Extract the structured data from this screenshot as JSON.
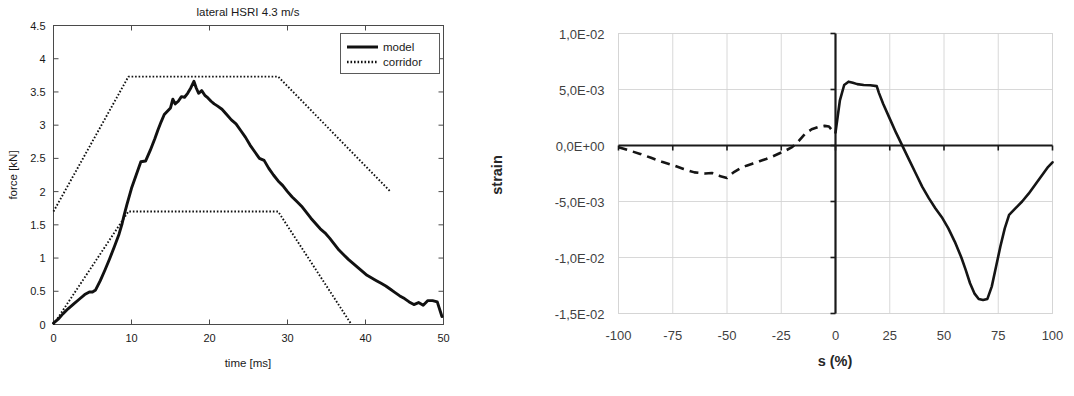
{
  "figure": {
    "background": "#ffffff",
    "panel_count": 2
  },
  "chart_data": [
    {
      "id": "lateral-hsri-force-time",
      "type": "line",
      "title": "lateral HSRI 4.3 m/s",
      "xlabel": "time [ms]",
      "ylabel": "force [kN]",
      "xlim": [
        0,
        50
      ],
      "ylim": [
        0,
        4.5
      ],
      "xticks": [
        0,
        10,
        20,
        30,
        40,
        50
      ],
      "xticklabels": [
        "0",
        "10",
        "20",
        "30",
        "40",
        "50"
      ],
      "yticks": [
        0,
        0.5,
        1,
        1.5,
        2,
        2.5,
        3,
        3.5,
        4,
        4.5
      ],
      "yticklabels": [
        "0",
        "0.5",
        "1",
        "1.5",
        "2",
        "2.5",
        "3",
        "3.5",
        "4",
        "4.5"
      ],
      "grid": false,
      "legend": {
        "position": "top-right",
        "entries": [
          {
            "label": "model",
            "style": "solid"
          },
          {
            "label": "corridor",
            "style": "dotted"
          }
        ]
      },
      "series": [
        {
          "name": "model",
          "style": "solid",
          "x": [
            0,
            0.6,
            1.2,
            1.9,
            2.6,
            3.3,
            4.0,
            4.6,
            5.0,
            5.4,
            6.0,
            6.6,
            7.2,
            7.8,
            8.4,
            8.8,
            9.0,
            9.4,
            10.0,
            10.6,
            11.2,
            11.8,
            12.4,
            13.0,
            13.4,
            13.8,
            14.2,
            14.6,
            15.0,
            15.3,
            15.6,
            16.0,
            16.4,
            16.8,
            17.2,
            17.6,
            18.0,
            18.3,
            18.6,
            19.0,
            19.4,
            19.8,
            20.2,
            20.6,
            21.0,
            21.6,
            22.2,
            22.8,
            23.4,
            24.0,
            24.6,
            25.2,
            25.8,
            26.4,
            27.0,
            27.6,
            28.2,
            28.8,
            29.4,
            30.0,
            30.6,
            31.2,
            31.8,
            32.4,
            33.0,
            33.6,
            34.2,
            34.8,
            35.4,
            36.0,
            36.6,
            37.2,
            37.8,
            38.4,
            39.0,
            39.6,
            40.2,
            40.8,
            41.4,
            42.0,
            42.6,
            43.2,
            43.8,
            44.4,
            45.0,
            45.6,
            46.2,
            46.8,
            47.4,
            48.0,
            48.6,
            49.2,
            49.8
          ],
          "y": [
            0.02,
            0.08,
            0.16,
            0.24,
            0.31,
            0.38,
            0.45,
            0.49,
            0.49,
            0.52,
            0.66,
            0.82,
            0.99,
            1.17,
            1.36,
            1.52,
            1.62,
            1.8,
            2.05,
            2.25,
            2.45,
            2.46,
            2.62,
            2.8,
            2.93,
            3.05,
            3.16,
            3.21,
            3.26,
            3.39,
            3.32,
            3.36,
            3.43,
            3.42,
            3.48,
            3.56,
            3.66,
            3.56,
            3.48,
            3.52,
            3.45,
            3.41,
            3.36,
            3.32,
            3.29,
            3.24,
            3.16,
            3.08,
            3.02,
            2.92,
            2.82,
            2.7,
            2.6,
            2.5,
            2.47,
            2.35,
            2.25,
            2.16,
            2.09,
            2.0,
            1.92,
            1.85,
            1.78,
            1.69,
            1.6,
            1.52,
            1.44,
            1.38,
            1.3,
            1.21,
            1.12,
            1.05,
            0.98,
            0.92,
            0.86,
            0.8,
            0.74,
            0.7,
            0.66,
            0.62,
            0.58,
            0.53,
            0.48,
            0.43,
            0.39,
            0.34,
            0.3,
            0.33,
            0.29,
            0.36,
            0.36,
            0.34,
            0.12
          ]
        },
        {
          "name": "corridor-upper",
          "style": "dotted",
          "x": [
            0,
            9.6,
            28.8,
            43.2
          ],
          "y": [
            1.7,
            3.73,
            3.73,
            2.0
          ]
        },
        {
          "name": "corridor-lower",
          "style": "dotted",
          "x": [
            0,
            9.6,
            28.8,
            38.2
          ],
          "y": [
            0.0,
            1.7,
            1.7,
            0.0
          ]
        }
      ]
    },
    {
      "id": "strain-vs-s",
      "type": "line",
      "title": "",
      "xlabel": "s (%)",
      "ylabel": "strain",
      "xlim": [
        -100,
        100
      ],
      "ylim": [
        -0.015,
        0.01
      ],
      "xticks": [
        -100,
        -75,
        -50,
        -25,
        0,
        25,
        50,
        75,
        100
      ],
      "xticklabels": [
        "-100",
        "-75",
        "-50",
        "-25",
        "0",
        "25",
        "50",
        "75",
        "100"
      ],
      "yticks": [
        0.01,
        0.005,
        0,
        -0.005,
        -0.01,
        -0.015
      ],
      "yticklabels": [
        "1,0E-02",
        "5,0E-03",
        "0,0E+00",
        "-5,0E-03",
        "-1,0E-02",
        "-1,5E-02"
      ],
      "grid": true,
      "legend": {
        "position": "none",
        "entries": []
      },
      "series": [
        {
          "name": "strain-negative-branch",
          "style": "dashed",
          "x": [
            -100,
            -95,
            -90,
            -85,
            -80,
            -75,
            -70,
            -65,
            -60,
            -57,
            -55,
            -53,
            -50,
            -47,
            -44,
            -41,
            -38,
            -35,
            -32,
            -29,
            -26,
            -23,
            -20,
            -17,
            -14,
            -11,
            -8,
            -5,
            -3,
            -1
          ],
          "y": [
            -0.00015,
            -0.00045,
            -0.00075,
            -0.0011,
            -0.00145,
            -0.00175,
            -0.0021,
            -0.0024,
            -0.0025,
            -0.00245,
            -0.00255,
            -0.00275,
            -0.0029,
            -0.0024,
            -0.00205,
            -0.0018,
            -0.0016,
            -0.0014,
            -0.0012,
            -0.00098,
            -0.00072,
            -0.00045,
            -0.00015,
            0.0004,
            0.00105,
            0.00145,
            0.00165,
            0.00175,
            0.0017,
            0.0012
          ]
        },
        {
          "name": "strain-positive-branch",
          "style": "solid",
          "x": [
            0,
            2,
            4,
            6,
            8,
            10,
            13,
            16,
            19,
            20,
            22,
            25,
            28,
            31,
            34,
            37,
            40,
            43,
            46,
            49,
            52,
            55,
            58,
            60,
            62,
            64,
            66,
            68,
            70,
            72,
            74,
            76,
            78,
            80,
            83,
            86,
            89,
            92,
            95,
            98,
            100
          ],
          "y": [
            0.00115,
            0.004,
            0.0054,
            0.0057,
            0.0056,
            0.00548,
            0.0054,
            0.00538,
            0.0053,
            0.0047,
            0.0037,
            0.0024,
            0.0011,
            -0.0001,
            -0.0013,
            -0.0025,
            -0.0037,
            -0.0047,
            -0.0056,
            -0.0064,
            -0.0074,
            -0.0086,
            -0.01,
            -0.0111,
            -0.0123,
            -0.0132,
            -0.0137,
            -0.0138,
            -0.0137,
            -0.0126,
            -0.0108,
            -0.009,
            -0.0074,
            -0.0062,
            -0.0056,
            -0.005,
            -0.0043,
            -0.0035,
            -0.0027,
            -0.0019,
            -0.0015
          ]
        }
      ]
    }
  ]
}
